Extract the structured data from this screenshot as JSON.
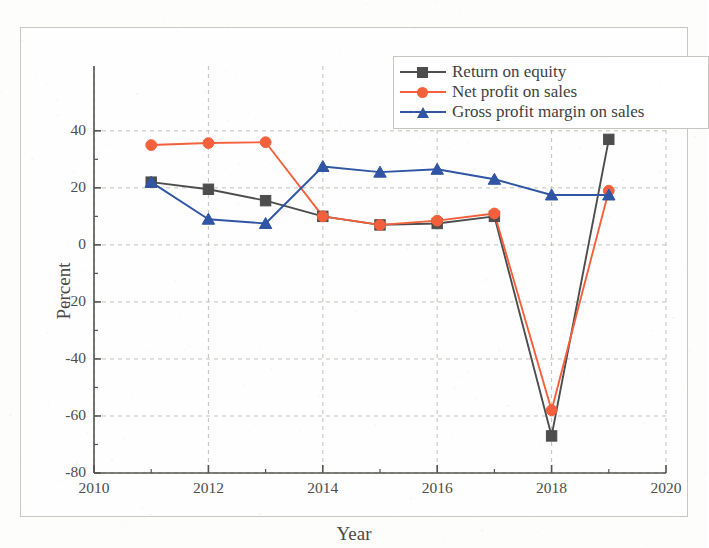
{
  "chart_data": {
    "type": "line",
    "title": "",
    "xlabel": "Year",
    "ylabel": "Percent",
    "xlim": [
      2010,
      2020
    ],
    "ylim": [
      -80,
      48
    ],
    "grid": true,
    "legend_position": "top-right",
    "xticks": [
      "2010",
      "2012",
      "2014",
      "2016",
      "2018",
      "2020"
    ],
    "xtick_values": [
      2010,
      2012,
      2014,
      2016,
      2018,
      2020
    ],
    "xminor_values": [
      2011,
      2013,
      2015,
      2017,
      2019
    ],
    "yticks": [
      "40",
      "20",
      "0",
      "-20",
      "-40",
      "-60",
      "-80"
    ],
    "ytick_values": [
      40,
      20,
      0,
      -20,
      -40,
      -60,
      -80
    ],
    "x": [
      2011,
      2012,
      2013,
      2014,
      2015,
      2016,
      2017,
      2018,
      2019
    ],
    "series": [
      {
        "name": "Return on equity",
        "color": "#4d4d4d",
        "marker": "square",
        "values": [
          22,
          19.5,
          15.5,
          10,
          7,
          7.5,
          10,
          -67,
          37
        ]
      },
      {
        "name": "Net profit on sales",
        "color": "#f4603c",
        "marker": "circle",
        "values": [
          35,
          35.7,
          36,
          10,
          7,
          8.5,
          11,
          -58,
          19
        ]
      },
      {
        "name": "Gross profit margin on sales",
        "color": "#2f55a4",
        "marker": "triangle",
        "values": [
          22,
          9,
          7.5,
          27.5,
          25.5,
          26.5,
          23,
          17.5,
          17.5
        ]
      }
    ]
  },
  "legend": {
    "entries": [
      {
        "label": "Return on equity"
      },
      {
        "label": "Net profit on sales"
      },
      {
        "label": "Gross profit margin on sales"
      }
    ]
  }
}
